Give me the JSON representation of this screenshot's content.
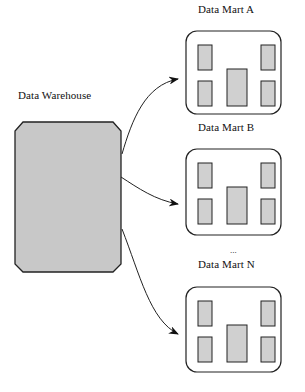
{
  "diagram": {
    "warehouse": {
      "label": "Data Warehouse",
      "fill": "#c8c8c8",
      "stroke": "#222222"
    },
    "marts": [
      {
        "label": "Data Mart  A",
        "top": 31
      },
      {
        "label": "Data Mart  B",
        "top": 149
      },
      {
        "label": "Data Mart N",
        "top": 287
      }
    ],
    "ellipsis": "...",
    "colors": {
      "mart_fill": "#ffffff",
      "block_fill": "#d0d0d0",
      "stroke": "#222222"
    }
  }
}
